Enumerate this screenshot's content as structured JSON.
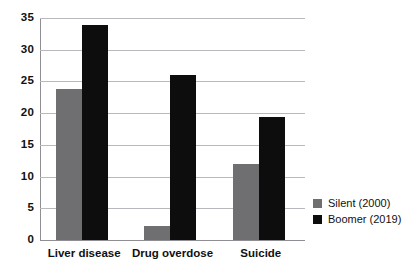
{
  "chart_data": {
    "type": "bar",
    "title": "",
    "subtitle": "",
    "xlabel": "",
    "ylabel": "",
    "categories": [
      "Liver disease",
      "Drug overdose",
      "Suicide"
    ],
    "series": [
      {
        "name": "Silent (2000)",
        "color": "#6f6f72",
        "values": [
          23.8,
          2.2,
          12.0
        ]
      },
      {
        "name": "Boomer (2019)",
        "color": "#0d0d0d",
        "values": [
          33.9,
          26.0,
          19.4
        ]
      }
    ],
    "ylim": [
      0,
      35
    ],
    "yticks": [
      0,
      5,
      10,
      15,
      20,
      25,
      30,
      35
    ],
    "ytick_labels": [
      "0",
      "5",
      "10",
      "15",
      "20",
      "25",
      "30",
      "35"
    ],
    "grid": true,
    "grid_axis": "y",
    "legend": true,
    "legend_position": "right"
  },
  "legend": {
    "items": [
      {
        "label": "Silent (2000)"
      },
      {
        "label": "Boomer (2019)"
      }
    ]
  },
  "colors": {
    "silent": "#6f6f72",
    "boomer": "#0d0d0d",
    "grid": "#b9b9bd",
    "axis": "#8e8e93",
    "text": "#111111",
    "background": "#ffffff"
  }
}
